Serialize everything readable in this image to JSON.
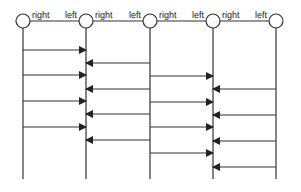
{
  "diagram": {
    "type": "message-sequence",
    "stroke_color": "#333333",
    "nodes": [
      {
        "id": "n1",
        "x": 23
      },
      {
        "id": "n2",
        "x": 86
      },
      {
        "id": "n3",
        "x": 150
      },
      {
        "id": "n4",
        "x": 213
      },
      {
        "id": "n5",
        "x": 276
      }
    ],
    "node_y": 21,
    "node_radius": 7,
    "lifeline_end_y": 179,
    "links": [
      {
        "from": "n1",
        "to": "n2",
        "left_label": "right",
        "right_label": "left"
      },
      {
        "from": "n2",
        "to": "n3",
        "left_label": "right",
        "right_label": "left"
      },
      {
        "from": "n3",
        "to": "n4",
        "left_label": "right",
        "right_label": "left"
      },
      {
        "from": "n4",
        "to": "n5",
        "left_label": "right",
        "right_label": "left"
      }
    ],
    "messages": [
      {
        "from": "n1",
        "to": "n2",
        "y": 50
      },
      {
        "from": "n1",
        "to": "n2",
        "y": 75
      },
      {
        "from": "n1",
        "to": "n2",
        "y": 101
      },
      {
        "from": "n1",
        "to": "n2",
        "y": 127
      },
      {
        "from": "n3",
        "to": "n2",
        "y": 63
      },
      {
        "from": "n3",
        "to": "n2",
        "y": 89
      },
      {
        "from": "n3",
        "to": "n2",
        "y": 114
      },
      {
        "from": "n3",
        "to": "n2",
        "y": 140
      },
      {
        "from": "n3",
        "to": "n4",
        "y": 76
      },
      {
        "from": "n3",
        "to": "n4",
        "y": 102
      },
      {
        "from": "n3",
        "to": "n4",
        "y": 127
      },
      {
        "from": "n3",
        "to": "n4",
        "y": 153
      },
      {
        "from": "n5",
        "to": "n4",
        "y": 89
      },
      {
        "from": "n5",
        "to": "n4",
        "y": 115
      },
      {
        "from": "n5",
        "to": "n4",
        "y": 141
      },
      {
        "from": "n5",
        "to": "n4",
        "y": 167
      }
    ]
  }
}
